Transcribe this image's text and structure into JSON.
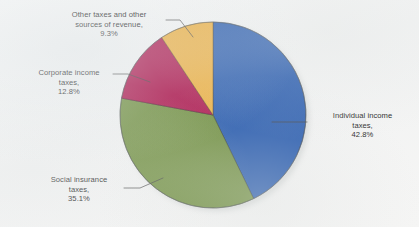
{
  "figure": {
    "background_color": "#f4f5f5",
    "text_color": "#1c1c1c"
  },
  "chart_data": {
    "type": "pie",
    "title": "",
    "subtitle": "",
    "xlabel": "",
    "ylabel": "",
    "legend_position": "none",
    "grid": false,
    "units": "percent",
    "total": 100.0,
    "start_angle_deg": 90,
    "direction": "clockwise",
    "categories": [
      "Individual income taxes",
      "Social insurance taxes",
      "Corporate income taxes",
      "Other taxes and other sources of revenue"
    ],
    "values": [
      42.8,
      35.1,
      12.8,
      9.3
    ],
    "colors": [
      "#2458ad",
      "#6f8e3e",
      "#ab0f48",
      "#edae3c"
    ],
    "slices": [
      {
        "name": "Individual income taxes",
        "value": 42.8,
        "value_label": "42.8%",
        "color": "#2458ad",
        "start_deg": 0.0,
        "sweep_deg": 154.08
      },
      {
        "name": "Social insurance taxes",
        "value": 35.1,
        "value_label": "35.1%",
        "color": "#6f8e3e",
        "start_deg": 154.08,
        "sweep_deg": 126.36
      },
      {
        "name": "Corporate income taxes",
        "value": 12.8,
        "value_label": "12.8%",
        "color": "#ab0f48",
        "start_deg": 280.44,
        "sweep_deg": 46.08
      },
      {
        "name": "Other taxes and other sources of revenue",
        "value": 9.3,
        "value_label": "9.3%",
        "color": "#edae3c",
        "start_deg": 326.52,
        "sweep_deg": 33.48
      }
    ],
    "annotations": [
      "Other taxes and other sources of revenue, 9.3%",
      "Corporate income taxes, 12.8%",
      "Social insurance taxes, 35.1%",
      "Individual income taxes, 42.8%"
    ]
  },
  "labels": {
    "other": "Other taxes and other\nsources of revenue,\n9.3%",
    "corporate": "Corporate income\ntaxes,\n12.8%",
    "social": "Social insurance\ntaxes,\n35.1%",
    "individual": "Individual income\ntaxes,\n42.8%"
  }
}
